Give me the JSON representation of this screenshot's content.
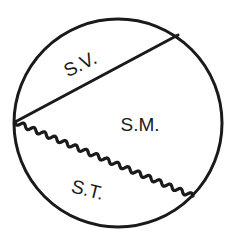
{
  "diagram": {
    "stroke_color": "#1a1a1a",
    "background_color": "#ffffff",
    "regions": [
      {
        "id": "sv",
        "label": "S.V."
      },
      {
        "id": "sm",
        "label": "S.M."
      },
      {
        "id": "st",
        "label": "S.T."
      }
    ],
    "boundaries": [
      {
        "id": "upper-chord",
        "style": "straight"
      },
      {
        "id": "lower-chord",
        "style": "wavy"
      }
    ]
  }
}
